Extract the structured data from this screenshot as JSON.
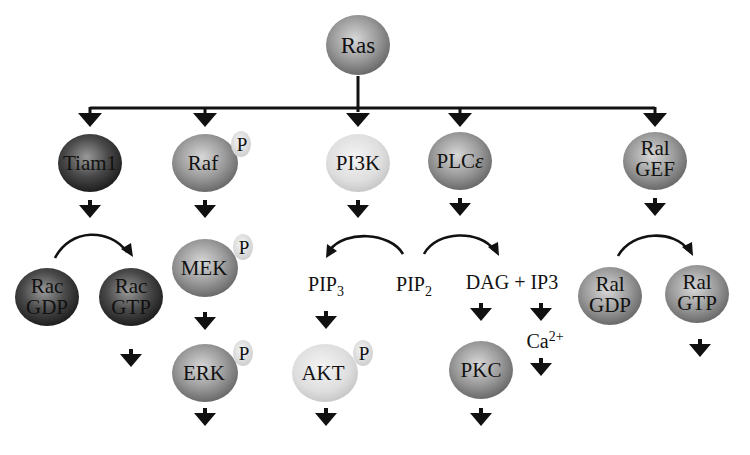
{
  "colors": {
    "dark": "#3a3a3a",
    "mid": "#8a8a8a",
    "light": "#dcdcdc",
    "phospho": "#e6e6e6",
    "ink": "#111111"
  },
  "nodes": {
    "ras": {
      "label": "Ras",
      "shade": "mid"
    },
    "tiam1": {
      "label": "Tiam1",
      "shade": "dark"
    },
    "raf": {
      "label": "Raf",
      "shade": "mid",
      "phospho": "P"
    },
    "pi3k": {
      "label": "PI3K",
      "shade": "light"
    },
    "plce": {
      "label": "PLC",
      "greek": "ε",
      "shade": "mid"
    },
    "ralgef": {
      "line1": "Ral",
      "line2": "GEF",
      "shade": "mid"
    },
    "rac_gdp": {
      "line1": "Rac",
      "line2": "GDP",
      "shade": "dark"
    },
    "rac_gtp": {
      "line1": "Rac",
      "line2": "GTP",
      "shade": "dark"
    },
    "mek": {
      "label": "MEK",
      "shade": "mid",
      "phospho": "P"
    },
    "erk": {
      "label": "ERK",
      "shade": "mid",
      "phospho": "P"
    },
    "akt": {
      "label": "AKT",
      "shade": "light",
      "phospho": "P"
    },
    "pkc": {
      "label": "PKC",
      "shade": "mid"
    },
    "ral_gdp": {
      "line1": "Ral",
      "line2": "GDP",
      "shade": "mid"
    },
    "ral_gtp": {
      "line1": "Ral",
      "line2": "GTP",
      "shade": "mid"
    }
  },
  "labels": {
    "pip3": {
      "base": "PIP",
      "sub": "3"
    },
    "pip2": {
      "base": "PIP",
      "sub": "2"
    },
    "dag_ip3": "DAG + IP3",
    "ca": {
      "base": "Ca",
      "sup": "2+"
    }
  }
}
